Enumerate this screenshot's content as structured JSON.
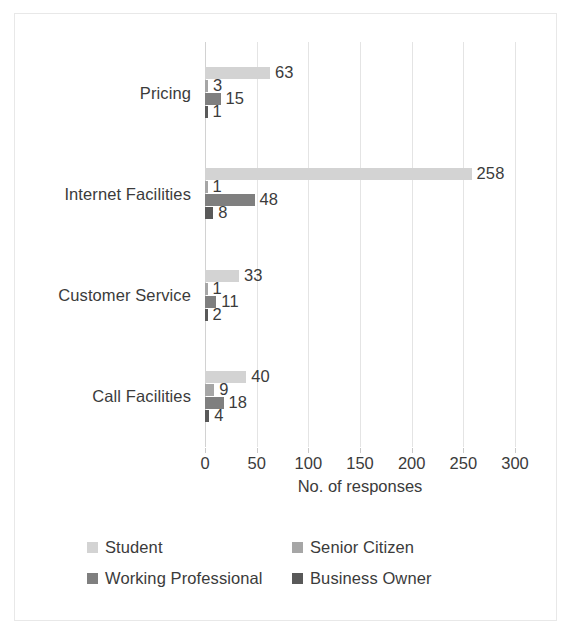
{
  "chart_data": {
    "type": "bar",
    "orientation": "horizontal",
    "title": "",
    "xlabel": "No. of responses",
    "ylabel": "",
    "xlim": [
      0,
      300
    ],
    "xticks": [
      0,
      50,
      100,
      150,
      200,
      250,
      300
    ],
    "grid": true,
    "legend_position": "bottom",
    "categories": [
      "Pricing",
      "Internet Facilities",
      "Customer Service",
      "Call Facilities"
    ],
    "series": [
      {
        "name": "Student",
        "color": "#d3d3d3",
        "values": [
          63,
          258,
          33,
          40
        ]
      },
      {
        "name": "Senior Citizen",
        "color": "#a6a6a6",
        "values": [
          3,
          1,
          1,
          9
        ]
      },
      {
        "name": "Working Professional",
        "color": "#7f7f7f",
        "values": [
          15,
          48,
          11,
          18
        ]
      },
      {
        "name": "Business Owner",
        "color": "#595959",
        "values": [
          1,
          8,
          2,
          4
        ]
      }
    ],
    "data_labels": {
      "Pricing": [
        "63",
        "3",
        "15",
        "1"
      ],
      "Internet Facilities": [
        "258",
        "1",
        "48",
        "8"
      ],
      "Customer Service": [
        "33",
        "1",
        "11",
        "2"
      ],
      "Call Facilities": [
        "40",
        "9",
        "18",
        "4"
      ]
    }
  },
  "axis": {
    "x_title": "No. of responses",
    "tick_labels": [
      "0",
      "50",
      "100",
      "150",
      "200",
      "250",
      "300"
    ]
  },
  "legend": {
    "items": [
      {
        "label": "Student",
        "color": "#d3d3d3"
      },
      {
        "label": "Senior Citizen",
        "color": "#a6a6a6"
      },
      {
        "label": "Working Professional",
        "color": "#7f7f7f"
      },
      {
        "label": "Business Owner",
        "color": "#595959"
      }
    ]
  }
}
